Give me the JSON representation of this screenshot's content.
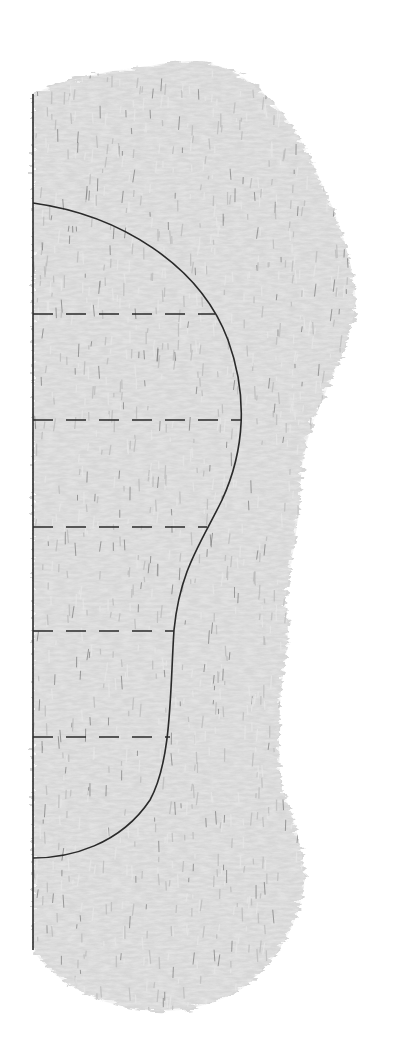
{
  "diagram": {
    "colors": {
      "background": "#ffffff",
      "grass_base": "#d6d6d6",
      "grass_light": "#e6e6e6",
      "grass_mid": "#bdbdbd",
      "grass_dark": "#6f6f6f",
      "line": "#2a2a2a"
    },
    "axis_line": {
      "x": 33,
      "y1": 94,
      "y2": 950
    },
    "outer_silhouette": "M33,94 C60,80 110,70 150,66 C180,60 200,58 230,70 C270,90 300,130 320,180 C340,220 352,260 356,300 C352,340 330,380 318,410 C305,440 300,470 300,500 C296,540 290,570 285,600 C288,620 290,640 282,680 C278,720 278,760 282,790 C296,820 302,850 305,880 C300,920 280,960 240,990 C200,1012 160,1016 120,1006 C80,996 50,975 33,950 Z",
    "boundary_curve": "M33,203 C120,215 200,265 228,340 C248,395 245,450 222,500 C200,545 180,570 174,630 C170,690 172,760 150,800 C120,845 70,858 33,858",
    "dashed_lines": [
      {
        "y": 314,
        "x_end": 215
      },
      {
        "y": 420,
        "x_end": 242
      },
      {
        "y": 527,
        "x_end": 207
      },
      {
        "y": 631,
        "x_end": 174
      },
      {
        "y": 737,
        "x_end": 170
      }
    ],
    "dash_pattern": "20 13"
  }
}
